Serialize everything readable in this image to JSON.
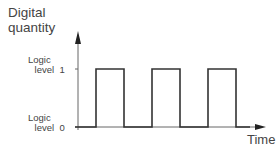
{
  "diagram": {
    "type": "digital-signal-waveform",
    "y_axis_label_line1": "Digital",
    "y_axis_label_line2": "quantity",
    "x_axis_label": "Time",
    "levels": {
      "high": {
        "line1": "Logic",
        "line2": "level  1"
      },
      "low": {
        "line1": "Logic",
        "line2": "level  0"
      }
    },
    "pulses": [
      {
        "rise_x": 96,
        "fall_x": 124
      },
      {
        "rise_x": 152,
        "fall_x": 180
      },
      {
        "rise_x": 208,
        "fall_x": 236
      }
    ],
    "colors": {
      "line": "#333333",
      "axis": "#666666",
      "text": "#444444"
    }
  }
}
